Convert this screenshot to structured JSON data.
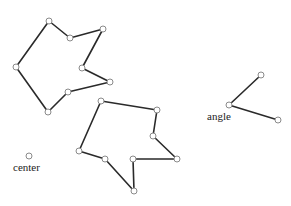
{
  "canvas": {
    "width": 291,
    "height": 206,
    "background": "#ffffff"
  },
  "colors": {
    "edge": "#2a2a2a",
    "vertex_stroke": "#8a8a8a",
    "vertex_fill": "#ffffff"
  },
  "shapes": {
    "polygon_1": {
      "closed": true,
      "points": [
        [
          49,
          21
        ],
        [
          70,
          38
        ],
        [
          103,
          29
        ],
        [
          82,
          68
        ],
        [
          110,
          82
        ],
        [
          68,
          92
        ],
        [
          48,
          112
        ],
        [
          16,
          67
        ]
      ]
    },
    "polygon_2": {
      "closed": true,
      "points": [
        [
          101,
          101
        ],
        [
          157,
          110
        ],
        [
          153,
          136
        ],
        [
          177,
          159
        ],
        [
          133,
          159
        ],
        [
          134,
          191
        ],
        [
          105,
          159
        ],
        [
          79,
          151
        ]
      ]
    },
    "angle": {
      "closed": false,
      "points": [
        [
          261,
          75
        ],
        [
          229,
          105
        ],
        [
          278,
          120
        ]
      ],
      "label": "angle",
      "label_pos": [
        207,
        111
      ]
    },
    "center": {
      "point": [
        29,
        156
      ],
      "label": "center",
      "label_pos": [
        13,
        162
      ]
    }
  }
}
